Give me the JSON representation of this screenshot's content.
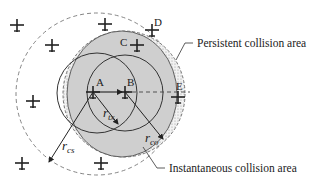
{
  "diagram": {
    "points": [
      {
        "id": "A",
        "label": "A",
        "x": 93,
        "y": 92
      },
      {
        "id": "B",
        "label": "B",
        "x": 125,
        "y": 92
      },
      {
        "id": "C",
        "label": "C",
        "x": 137,
        "y": 45
      },
      {
        "id": "D",
        "label": "D",
        "x": 152,
        "y": 30
      },
      {
        "id": "E",
        "label": "E",
        "x": 178,
        "y": 97
      }
    ],
    "aircraft": [
      {
        "x": 17,
        "y": 25
      },
      {
        "x": 52,
        "y": 45
      },
      {
        "x": 33,
        "y": 101
      },
      {
        "x": 22,
        "y": 163
      },
      {
        "x": 105,
        "y": 24
      },
      {
        "x": 101,
        "y": 163
      }
    ],
    "radii": {
      "r_tx": {
        "base": "r",
        "sub": "tx"
      },
      "r_co": {
        "base": "r",
        "sub": "co"
      },
      "r_cs": {
        "base": "r",
        "sub": "cs"
      }
    },
    "legend": {
      "persistent": "Persistent collision area",
      "instantaneous": "Instantaneous collision area"
    },
    "colors": {
      "shaded_area": "#cfcfcf",
      "persistent_hatch": "#e6e6e6",
      "lines": "#333333"
    }
  }
}
